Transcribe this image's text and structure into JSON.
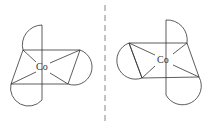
{
  "diagram": {
    "type": "mirror-image enantiomers of octahedral cobalt complex",
    "left_molecule": {
      "center_label": "Co"
    },
    "right_molecule": {
      "center_label": "Co"
    },
    "mirror_plane": "dashed vertical line",
    "colors": {
      "stroke": "#333333",
      "mirror": "#888888"
    }
  }
}
